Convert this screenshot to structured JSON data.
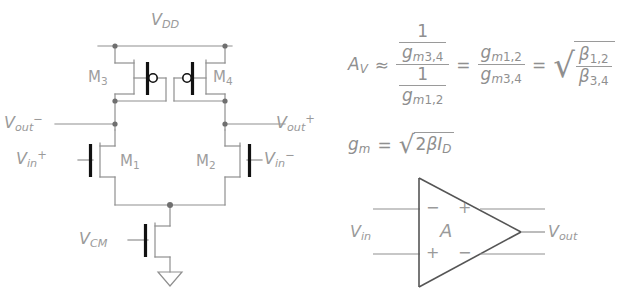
{
  "figure": {
    "title_circuit": "CMOS differential amplifier",
    "colors": {
      "line": "#8f8f8f",
      "text": "#9a9a9a",
      "gate_bar": "#1a1a1a",
      "background": "#ffffff"
    }
  },
  "circuit": {
    "supply_label": {
      "base": "V",
      "sub": "DD"
    },
    "ground_label": "",
    "transistors": [
      {
        "id": "M3",
        "base": "M",
        "sub": "3",
        "type": "PMOS"
      },
      {
        "id": "M4",
        "base": "M",
        "sub": "4",
        "type": "PMOS"
      },
      {
        "id": "M1",
        "base": "M",
        "sub": "1",
        "type": "NMOS"
      },
      {
        "id": "M2",
        "base": "M",
        "sub": "2",
        "type": "NMOS"
      },
      {
        "id": "Mtail",
        "base": "M",
        "sub": "",
        "type": "NMOS"
      }
    ],
    "nodes": [
      {
        "name": "vout-minus",
        "base": "V",
        "sub": "out",
        "sup": "−"
      },
      {
        "name": "vout-plus",
        "base": "V",
        "sub": "out",
        "sup": "+"
      },
      {
        "name": "vin-plus",
        "base": "V",
        "sub": "in",
        "sup": "+"
      },
      {
        "name": "vin-minus",
        "base": "V",
        "sub": "in",
        "sup": "−"
      },
      {
        "name": "vcm",
        "base": "V",
        "sub": "CM",
        "sup": ""
      }
    ]
  },
  "equations": {
    "gain": {
      "lhs": {
        "base": "A",
        "sub": "V"
      },
      "approx": "≈",
      "frac_outer": {
        "num": {
          "num": "1",
          "den_base": "g",
          "den_sub_m": "m",
          "den_sub_idx": "3,4"
        },
        "den": {
          "num": "1",
          "den_base": "g",
          "den_sub_m": "m",
          "den_sub_idx": "1,2"
        }
      },
      "eq1": "=",
      "frac_gm": {
        "num_base": "g",
        "num_sub_m": "m",
        "num_sub_idx": "1,2",
        "den_base": "g",
        "den_sub_m": "m",
        "den_sub_idx": "3,4"
      },
      "eq2": "=",
      "radical": "√",
      "frac_beta": {
        "num_base": "β",
        "num_sub": "1,2",
        "den_base": "β",
        "den_sub": "3,4"
      }
    },
    "gm": {
      "lhs_base": "g",
      "lhs_sub": "m",
      "eq": "=",
      "radical": "√",
      "radicand_pre": "2",
      "radicand_beta": "β",
      "radicand_i": "I",
      "radicand_i_sub": "D"
    }
  },
  "opamp": {
    "gain_symbol": "A",
    "input_label": {
      "base": "V",
      "sub": "in"
    },
    "output_label": {
      "base": "V",
      "sub": "out"
    },
    "terminal_signs": {
      "top_outside": "−",
      "top_inside": "+",
      "bottom_outside": "+",
      "bottom_inside": "−"
    }
  }
}
